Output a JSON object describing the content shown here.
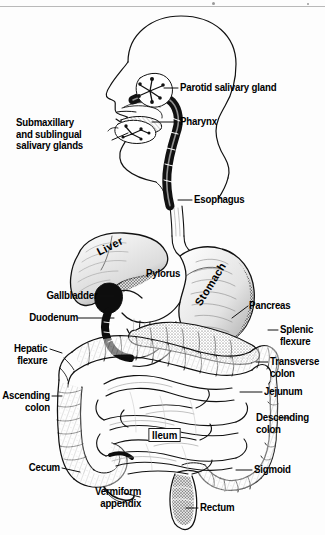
{
  "figure": {
    "style": "black and white engraved anatomical line drawing",
    "ink_color": "#111111",
    "background_color": "#fdfdfd"
  },
  "labels": {
    "parotid": "Parotid salivary gland",
    "pharynx": "Pharynx",
    "submaxillary": "Submaxillary\nand sublingual\nsalivary glands",
    "esophagus": "Esophagus",
    "liver": "Liver",
    "pylorus": "Pylorus",
    "stomach": "Stomach",
    "gallbladder": "Gallbladder",
    "duodenum": "Duodenum",
    "pancreas": "Pancreas",
    "splenic_flexure": "Splenic\nflexure",
    "hepatic_flexure": "Hepatic\nflexure",
    "transverse_colon": "Transverse\ncolon",
    "jejunum": "Jejunum",
    "ascending_colon": "Ascending\ncolon",
    "descending_colon": "Descending\ncolon",
    "ileum": "Ileum",
    "cecum": "Cecum",
    "sigmoid": "Sigmoid",
    "vermiform_appendix": "Vermiform\nappendix",
    "rectum": "Rectum"
  }
}
